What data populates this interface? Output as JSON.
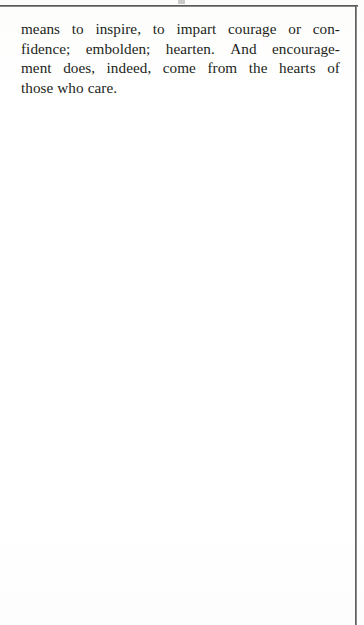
{
  "page": {
    "background_color": "#fefefe",
    "ink_color": "#231f20",
    "rule_color": "#4a4a4a"
  },
  "rules": {
    "header_rule_name": "header-rule",
    "right_edge_rule_name": "right-edge-rule"
  },
  "body": {
    "paragraph_text": "means to inspire, to impart courage or confidence; embolden; hearten. And encouragement does, indeed, come from the hearts of those who care.",
    "lines": [
      {
        "id": "line-1",
        "text": "means to inspire, to impart courage or con-",
        "words": [
          "means",
          "to",
          "inspire,",
          "to",
          "impart",
          "courage",
          "or",
          "con-"
        ]
      },
      {
        "id": "line-2",
        "text": "fidence; embolden; hearten. And encourage-",
        "words": [
          "fidence;",
          "embolden;",
          "hearten.",
          "And",
          "encourage-"
        ]
      },
      {
        "id": "line-3",
        "text": "ment does, indeed, come from the hearts of",
        "words": [
          "ment",
          "does,",
          "indeed,",
          "come",
          "from",
          "the",
          "hearts",
          "of"
        ]
      },
      {
        "id": "line-4",
        "text": "those who care.",
        "words": [
          "those",
          "who",
          "care."
        ]
      }
    ]
  }
}
